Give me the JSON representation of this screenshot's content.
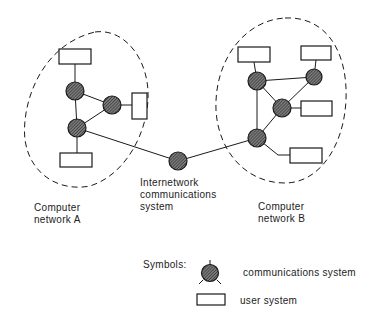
{
  "diagram": {
    "network_a": {
      "label_line1": "Computer",
      "label_line2": "network A",
      "comm_nodes": [
        {
          "id": "a1",
          "cx": 75,
          "cy": 91
        },
        {
          "id": "a2",
          "cx": 112,
          "cy": 105
        },
        {
          "id": "a3",
          "cx": 77,
          "cy": 128
        }
      ],
      "user_systems": [
        {
          "id": "ua-top",
          "x": 59,
          "y": 49,
          "w": 32,
          "h": 15
        },
        {
          "id": "ua-right",
          "x": 132,
          "y": 93,
          "w": 15,
          "h": 26
        },
        {
          "id": "ua-bottom",
          "x": 60,
          "y": 153,
          "w": 32,
          "h": 14
        }
      ]
    },
    "network_b": {
      "label_line1": "Computer",
      "label_line2": "network B",
      "comm_nodes": [
        {
          "id": "b1",
          "cx": 257,
          "cy": 81
        },
        {
          "id": "b2",
          "cx": 314,
          "cy": 77
        },
        {
          "id": "b3",
          "cx": 282,
          "cy": 108
        },
        {
          "id": "b4",
          "cx": 257,
          "cy": 138
        }
      ],
      "user_systems": [
        {
          "id": "ub-topleft",
          "x": 238,
          "y": 47,
          "w": 32,
          "h": 15
        },
        {
          "id": "ub-topright",
          "x": 301,
          "y": 46,
          "w": 30,
          "h": 14
        },
        {
          "id": "ub-right",
          "x": 301,
          "y": 101,
          "w": 31,
          "h": 15
        },
        {
          "id": "ub-bottom",
          "x": 290,
          "y": 148,
          "w": 32,
          "h": 15
        }
      ]
    },
    "internetwork": {
      "label_line1": "Internetwork",
      "label_line2": "communications",
      "label_line3": "system",
      "node": {
        "cx": 178,
        "cy": 161
      }
    },
    "legend": {
      "title": "Symbols:",
      "comm_label": "communications system",
      "user_label": "user system"
    },
    "colors": {
      "stroke": "#1a1a1a",
      "node_fill": "#5a5a5a",
      "hatch": "#2a2a2a"
    }
  }
}
